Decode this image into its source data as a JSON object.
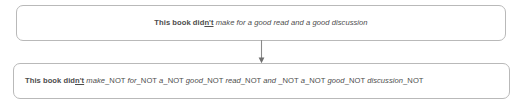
{
  "diagram": {
    "type": "flow",
    "colors": {
      "box_border": "#b9b9b9",
      "box_fill": "#ffffff",
      "text": "#4d4d4d",
      "arrow": "#808080",
      "page_background": "#ffffff"
    }
  },
  "source": {
    "label": "source-sentence",
    "full_text": "This book didn't make for a good read and a good discussion",
    "tokens": [
      {
        "text": "This book did",
        "style": "plain"
      },
      {
        "text": "n't",
        "style": "cue"
      },
      {
        "text": " ",
        "style": "space"
      },
      {
        "text": "make for a good read and a good discussion",
        "style": "scope"
      }
    ]
  },
  "result": {
    "label": "transformed-sentence",
    "full_text": "This book didn't make_NOT for_NOT a_NOT good_NOT read_NOT and _NOT a_NOT good_NOT discussion_NOT",
    "tokens": [
      {
        "text": "This book did",
        "style": "plain"
      },
      {
        "text": "n't",
        "style": "cue"
      },
      {
        "text": " ",
        "style": "space"
      },
      {
        "text": "make",
        "style": "scope"
      },
      {
        "text": "_NOT ",
        "style": "suffix"
      },
      {
        "text": "for",
        "style": "scope"
      },
      {
        "text": "_NOT ",
        "style": "suffix"
      },
      {
        "text": "a",
        "style": "scope"
      },
      {
        "text": "_NOT ",
        "style": "suffix"
      },
      {
        "text": "good",
        "style": "scope"
      },
      {
        "text": "_NOT ",
        "style": "suffix"
      },
      {
        "text": "read",
        "style": "scope"
      },
      {
        "text": "_NOT ",
        "style": "suffix"
      },
      {
        "text": "and ",
        "style": "scope"
      },
      {
        "text": "_NOT ",
        "style": "suffix"
      },
      {
        "text": "a",
        "style": "scope"
      },
      {
        "text": "_NOT ",
        "style": "suffix"
      },
      {
        "text": "good",
        "style": "scope"
      },
      {
        "text": "_NOT ",
        "style": "suffix"
      },
      {
        "text": "discussion",
        "style": "scope"
      },
      {
        "text": "_NOT",
        "style": "suffix"
      }
    ]
  },
  "connector": {
    "label": "downward-arrow",
    "direction": "down",
    "from": "source-sentence",
    "to": "transformed-sentence"
  }
}
